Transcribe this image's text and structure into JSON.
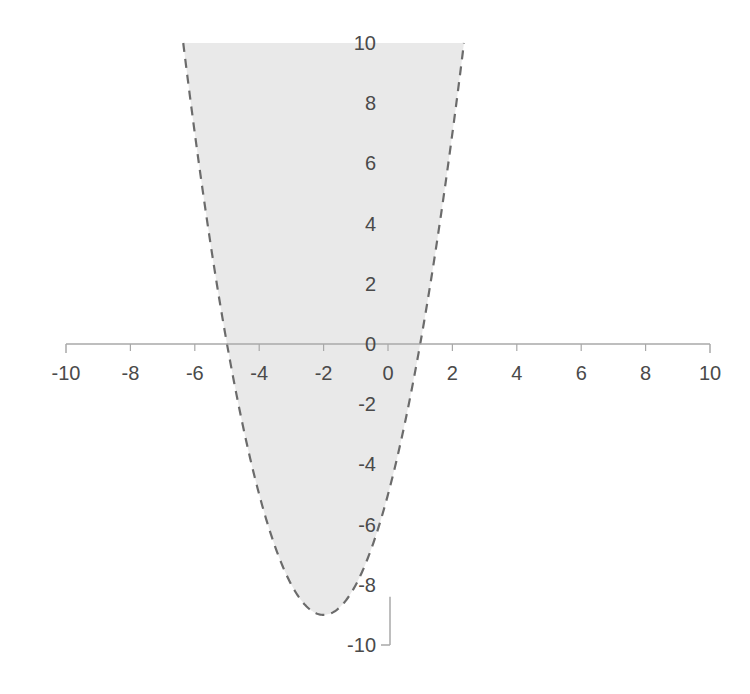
{
  "chart_data": {
    "type": "area",
    "title": "",
    "subtitle": "",
    "xlabel": "",
    "ylabel": "",
    "xlim": [
      -10,
      10
    ],
    "ylim": [
      -10,
      10
    ],
    "grid": false,
    "legend": null,
    "x_ticks": [
      -10,
      -8,
      -6,
      -4,
      -2,
      0,
      2,
      4,
      6,
      8,
      10
    ],
    "x_tick_labels": [
      "-10",
      "-8",
      "-6",
      "-4",
      "-2",
      "0",
      "2",
      "4",
      "6",
      "8",
      "10"
    ],
    "y_ticks": [
      10,
      8,
      6,
      4,
      2,
      0,
      -2,
      -4,
      -6,
      -8,
      -10
    ],
    "y_tick_labels": [
      "10",
      "8",
      "6",
      "4",
      "2",
      "0",
      "-2",
      "-4",
      "-6",
      "-8",
      "-10"
    ],
    "series": [
      {
        "name": "y = x^2 + 4x - 5",
        "style": "dashed-boundary-with-shaded-region",
        "shaded": true,
        "shade_direction": "above",
        "roots": [
          -5,
          1
        ],
        "vertex": [
          -2,
          -9
        ],
        "x": [
          -6.5,
          -6.0,
          -5.5,
          -5.0,
          -4.5,
          -4.0,
          -3.5,
          -3.0,
          -2.5,
          -2.0,
          -1.5,
          -1.0,
          -0.5,
          0.0,
          0.5,
          1.0,
          1.5,
          2.0,
          2.4
        ],
        "values": [
          13.25,
          7.0,
          3.25,
          0.0,
          -2.75,
          -5.0,
          -6.75,
          -8.0,
          -8.75,
          -9.0,
          -8.75,
          -8.0,
          -6.75,
          -5.0,
          -2.75,
          0.0,
          3.25,
          7.0,
          10.36
        ]
      }
    ],
    "colors": {
      "fill": "#e9e9e9",
      "boundary": "#6b6b6b",
      "axis": "#a8a8a8",
      "tick_text": "#4a4a4a",
      "background": "#ffffff"
    },
    "geometry": {
      "x_zero_px": 388,
      "y_zero_px": 344,
      "px_per_unit_x": 32.2,
      "px_per_unit_y": 30.1
    }
  },
  "axes": {
    "x_axis_name": "x-axis",
    "y_axis_name": "y-axis"
  }
}
